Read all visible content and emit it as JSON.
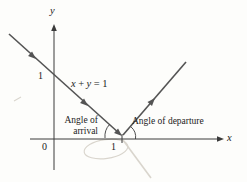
{
  "colors": {
    "background": "#fdfdfb",
    "line": "#545454",
    "axis": "#3a3a3a",
    "text": "#1c1c1c",
    "faint": "#d9d5cd"
  },
  "labels": {
    "y_axis": "y",
    "x_axis": "x",
    "origin": "0",
    "x_unit": "1",
    "y_unit": "1"
  },
  "equation": {
    "x": "x",
    "plus": "+",
    "y": "y",
    "equals": "=",
    "one": "1"
  },
  "annotations": {
    "arrival_top": "Angle of",
    "arrival_bottom": "arrival",
    "departure": "Angle of departure"
  }
}
